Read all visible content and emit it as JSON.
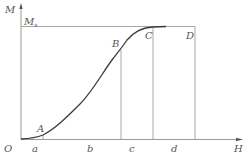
{
  "diagram": {
    "title": "",
    "axes": {
      "y_label": "M",
      "x_label": "H",
      "origin_label": "O",
      "saturation_label": "M",
      "saturation_sub": "s"
    },
    "points": [
      {
        "label": "A"
      },
      {
        "label": "B"
      },
      {
        "label": "C"
      },
      {
        "label": "D"
      }
    ],
    "x_ticks": [
      {
        "label": "a"
      },
      {
        "label": "b"
      },
      {
        "label": "c"
      },
      {
        "label": "d"
      }
    ],
    "colors": {
      "guide_lines": "#a8a8a8",
      "curve": "#3a3a3a",
      "text": "#555555"
    }
  }
}
